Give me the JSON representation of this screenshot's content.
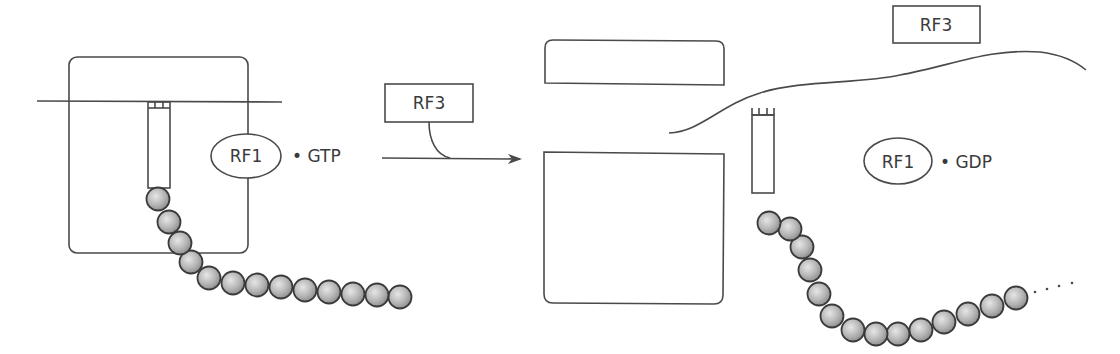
{
  "diagram": {
    "type": "translation-termination-schematic",
    "left_panel": {
      "ribosome": "ribosome-outline",
      "factor_label": "RF1",
      "bound_nucleotide": "• GTP",
      "peptide_beads": 13
    },
    "transition": {
      "factor_label": "RF3",
      "arrow": "reaction-arrow"
    },
    "right_panel": {
      "released_factor_label": "RF3",
      "factor_label": "RF1",
      "bound_nucleotide": "• GDP",
      "peptide_beads": 14,
      "continuation": "...."
    },
    "colors": {
      "line": "#4a4a4a",
      "bead_fill": "#b8b8b8",
      "bead_stroke": "#3a3a3a",
      "text": "#3a3a3a",
      "background": "#ffffff"
    }
  }
}
